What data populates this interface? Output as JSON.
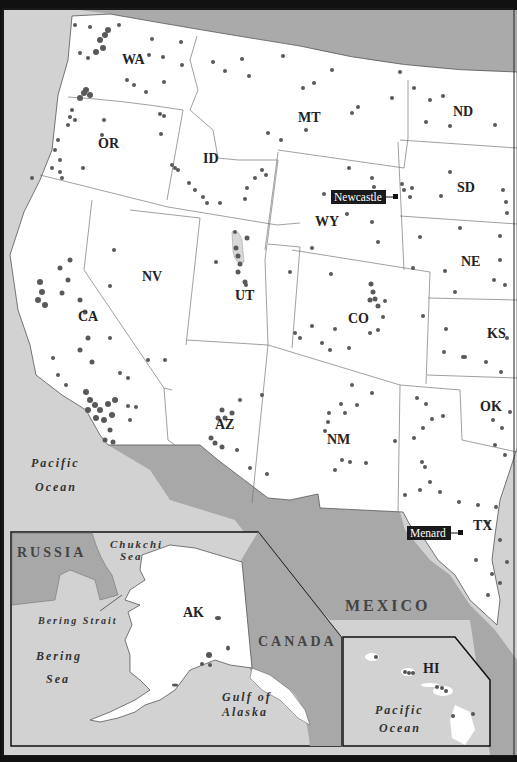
{
  "map": {
    "title": "Western United States site map",
    "colors": {
      "frame": "#111111",
      "land_us": "#ffffff",
      "land_foreign": "#a8a8a8",
      "water": "#d0d0d0",
      "dots": "#555555",
      "border": "#777777",
      "city_box": "#1a1a1a"
    },
    "states": [
      {
        "abbr": "WA",
        "x": 122,
        "y": 64
      },
      {
        "abbr": "OR",
        "x": 98,
        "y": 148
      },
      {
        "abbr": "ID",
        "x": 203,
        "y": 163
      },
      {
        "abbr": "MT",
        "x": 310,
        "y": 122
      },
      {
        "abbr": "ND",
        "x": 465,
        "y": 116
      },
      {
        "abbr": "SD",
        "x": 467,
        "y": 192
      },
      {
        "abbr": "WY",
        "x": 326,
        "y": 226
      },
      {
        "abbr": "NE",
        "x": 472,
        "y": 266
      },
      {
        "abbr": "NV",
        "x": 151,
        "y": 281
      },
      {
        "abbr": "UT",
        "x": 245,
        "y": 300
      },
      {
        "abbr": "CO",
        "x": 359,
        "y": 323
      },
      {
        "abbr": "KS",
        "x": 494,
        "y": 338
      },
      {
        "abbr": "CA",
        "x": 88,
        "y": 321
      },
      {
        "abbr": "AZ",
        "x": 225,
        "y": 429
      },
      {
        "abbr": "NM",
        "x": 338,
        "y": 444
      },
      {
        "abbr": "OK",
        "x": 490,
        "y": 411
      },
      {
        "abbr": "TX",
        "x": 483,
        "y": 530
      },
      {
        "abbr": "AK",
        "x": 193,
        "y": 617
      },
      {
        "abbr": "HI",
        "x": 432,
        "y": 673
      }
    ],
    "cities": [
      {
        "name": "Newcastle",
        "label_x": 331,
        "label_y": 196,
        "marker_x": 395,
        "marker_y": 198
      },
      {
        "name": "Menard",
        "label_x": 407,
        "label_y": 528,
        "marker_x": 460,
        "marker_y": 534
      }
    ],
    "countries": [
      {
        "name": "RUSSIA",
        "x": 17,
        "y": 557
      },
      {
        "name": "CANADA",
        "x": 258,
        "y": 646
      },
      {
        "name": "MEXICO",
        "x": 345,
        "y": 611
      }
    ],
    "water_bodies": [
      {
        "lines": [
          "Pacific",
          "Ocean"
        ],
        "x": 31,
        "y": 467
      },
      {
        "lines": [
          "Chukchi",
          "Sea"
        ],
        "x": 108,
        "y": 548
      },
      {
        "lines": [
          "Bering",
          "Sea"
        ],
        "x": 36,
        "y": 660
      },
      {
        "lines": [
          "Gulf of",
          "Alaska"
        ],
        "x": 222,
        "y": 701
      },
      {
        "lines": [
          "Pacific",
          "Ocean"
        ],
        "x": 375,
        "y": 714
      }
    ],
    "features": [
      {
        "name": "Bering Strait",
        "x": 38,
        "y": 624
      }
    ]
  }
}
